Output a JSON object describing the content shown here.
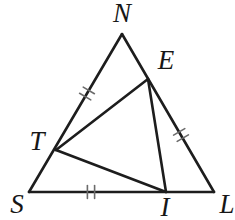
{
  "diagram": {
    "background_color": "#ffffff",
    "line_color": "#1d1d1d",
    "tick_color": "#6b6b6b",
    "label_color": "#161616",
    "line_width": 2.6,
    "tick_width": 1.6,
    "tick_length": 13,
    "tick_spacing": 7.2,
    "points": {
      "N": {
        "label": "N",
        "x": 122,
        "y": 34,
        "label_x": 122,
        "label_y": 13
      },
      "E": {
        "label": "E",
        "x": 148,
        "y": 79,
        "label_x": 166,
        "label_y": 60
      },
      "L": {
        "label": "L",
        "x": 214,
        "y": 192,
        "label_x": 227,
        "label_y": 204
      },
      "I": {
        "label": "I",
        "x": 166,
        "y": 192,
        "label_x": 165,
        "label_y": 207
      },
      "S": {
        "label": "S",
        "x": 29,
        "y": 192,
        "label_x": 17,
        "label_y": 204
      },
      "T": {
        "label": "T",
        "x": 56,
        "y": 150,
        "label_x": 37,
        "label_y": 141
      }
    },
    "segments": [
      {
        "from": "N",
        "to": "S"
      },
      {
        "from": "N",
        "to": "L"
      },
      {
        "from": "S",
        "to": "L"
      },
      {
        "from": "T",
        "to": "E"
      },
      {
        "from": "T",
        "to": "I"
      },
      {
        "from": "E",
        "to": "I"
      }
    ],
    "tick_marks": [
      {
        "on_segment": "N-T",
        "cx": 87,
        "cy": 93.5,
        "line_angle_deg": 120.5,
        "count": 2
      },
      {
        "on_segment": "E-L",
        "cx": 181,
        "cy": 135,
        "line_angle_deg": 59.8,
        "count": 2
      },
      {
        "on_segment": "S-I",
        "cx": 91,
        "cy": 192,
        "line_angle_deg": 0,
        "count": 2
      }
    ]
  }
}
